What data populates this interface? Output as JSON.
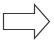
{
  "diagram": {
    "shape": "right-arrow",
    "direction": "right",
    "fill": "#ffffff",
    "stroke": "#3a3a3a",
    "label": ""
  }
}
